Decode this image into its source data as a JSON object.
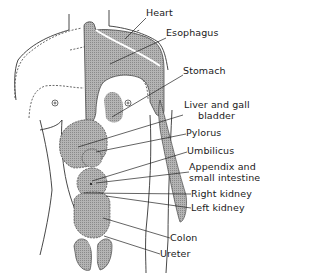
{
  "figure": {
    "title": "",
    "labels": [
      {
        "id": "heart",
        "text": "Heart",
        "x": 146,
        "y": 8
      },
      {
        "id": "esophagus",
        "text": "Esophagus",
        "x": 166,
        "y": 28
      },
      {
        "id": "stomach",
        "text": "Stomach",
        "x": 183,
        "y": 66
      },
      {
        "id": "liver",
        "text": "Liver and gall",
        "text2": "bladder",
        "x": 184,
        "y": 103
      },
      {
        "id": "pylorus",
        "text": "Pylorus",
        "x": 186,
        "y": 128
      },
      {
        "id": "umbilicus",
        "text": "Umbilicus",
        "x": 187,
        "y": 146
      },
      {
        "id": "appendix",
        "text": "Appendix and",
        "text2": "small intestine",
        "x": 189,
        "y": 163
      },
      {
        "id": "right-kidney",
        "text": "Right kidney",
        "x": 191,
        "y": 189
      },
      {
        "id": "left-kidney",
        "text": "Left kidney",
        "x": 191,
        "y": 203
      },
      {
        "id": "colon",
        "text": "Colon",
        "x": 170,
        "y": 233
      },
      {
        "id": "ureter",
        "text": "Ureter",
        "x": 160,
        "y": 249
      }
    ],
    "colors": {
      "shade": "#9a9a9a",
      "line": "#222222",
      "background": "#ffffff"
    }
  }
}
